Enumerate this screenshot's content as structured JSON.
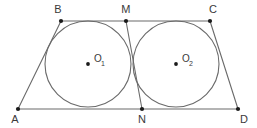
{
  "figure": {
    "background_color": "#ffffff",
    "stroke_color": "#6a6a6a",
    "dot_color": "#1a1a1a",
    "label_color": "#3a3a3a",
    "width": 257,
    "height": 128,
    "points": [
      {
        "id": "A",
        "label": "A",
        "x": 18,
        "y": 109,
        "label_x": 15,
        "label_y": 123,
        "anchor": "middle"
      },
      {
        "id": "B",
        "label": "B",
        "x": 61,
        "y": 21,
        "label_x": 58,
        "label_y": 13,
        "anchor": "middle"
      },
      {
        "id": "M",
        "label": "M",
        "x": 126,
        "y": 21,
        "label_x": 126,
        "label_y": 13,
        "anchor": "middle"
      },
      {
        "id": "C",
        "label": "C",
        "x": 210,
        "y": 21,
        "label_x": 213,
        "label_y": 13,
        "anchor": "middle"
      },
      {
        "id": "D",
        "label": "D",
        "x": 238,
        "y": 109,
        "label_x": 244,
        "label_y": 123,
        "anchor": "middle"
      },
      {
        "id": "N",
        "label": "N",
        "x": 142,
        "y": 109,
        "label_x": 142,
        "label_y": 123,
        "anchor": "middle"
      }
    ],
    "segments": [
      {
        "id": "AB",
        "label": "AB",
        "x1": 18,
        "y1": 109,
        "x2": 61,
        "y2": 21
      },
      {
        "id": "BC",
        "label": "BC",
        "x1": 61,
        "y1": 21,
        "x2": 210,
        "y2": 21
      },
      {
        "id": "CD",
        "label": "CD",
        "x1": 210,
        "y1": 21,
        "x2": 238,
        "y2": 109
      },
      {
        "id": "AD",
        "label": "AD",
        "x1": 18,
        "y1": 109,
        "x2": 238,
        "y2": 109
      },
      {
        "id": "MN",
        "label": "MN",
        "x1": 126,
        "y1": 21,
        "x2": 142,
        "y2": 109
      }
    ],
    "circles": [
      {
        "id": "circle1",
        "center_label": "O",
        "center_subscript": "1",
        "cx": 88,
        "cy": 64,
        "r": 43,
        "label_x": 94,
        "label_y": 62,
        "sub_x": 101,
        "sub_y": 66
      },
      {
        "id": "circle2",
        "center_label": "O",
        "center_subscript": "2",
        "cx": 176,
        "cy": 64,
        "r": 43,
        "label_x": 182,
        "label_y": 62,
        "sub_x": 189,
        "sub_y": 66
      }
    ]
  }
}
